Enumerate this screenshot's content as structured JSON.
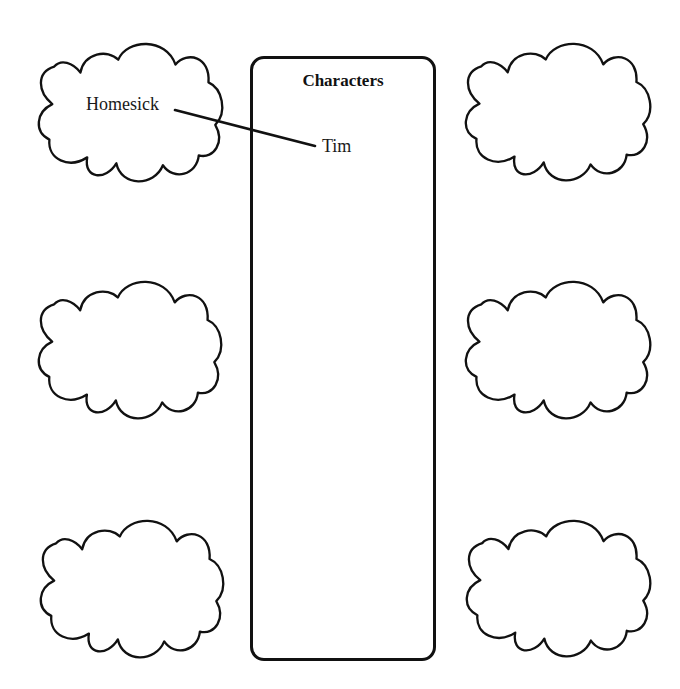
{
  "diagram": {
    "type": "character web graphic organizer",
    "center_box": {
      "title": "Characters",
      "entries": [
        "Tim"
      ]
    },
    "clouds": [
      {
        "position": "top-left",
        "text": "Homesick"
      },
      {
        "position": "middle-left",
        "text": ""
      },
      {
        "position": "bottom-left",
        "text": ""
      },
      {
        "position": "top-right",
        "text": ""
      },
      {
        "position": "middle-right",
        "text": ""
      },
      {
        "position": "bottom-right",
        "text": ""
      }
    ],
    "connections": [
      {
        "from": "Homesick",
        "to": "Tim"
      }
    ],
    "colors": {
      "stroke": "#111111",
      "background": "#ffffff",
      "text": "#1a1a1a"
    }
  }
}
